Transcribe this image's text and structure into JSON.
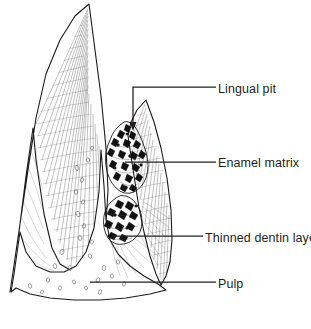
{
  "figure": {
    "line_color": "#1a1a1a",
    "text_color": "#231f20",
    "background_color": "#ffffff"
  },
  "labels": [
    {
      "id": "lingual-pit",
      "text": "Lingual pit",
      "text_x": 218,
      "text_y": 93,
      "leader_type": "elbow-arrow",
      "leader": "M216,87 L133,87 L133,126",
      "arrow_tip_x": 133,
      "arrow_tip_y": 130
    },
    {
      "id": "enamel-matrix",
      "text": "Enamel matrix",
      "text_x": 218,
      "text_y": 167,
      "leader_type": "straight",
      "leader": "M216,162 L125,162"
    },
    {
      "id": "thinned-dentin-layer",
      "text": "Thinned dentin layer",
      "text_x": 205,
      "text_y": 242,
      "leader_type": "straight",
      "leader": "M203,236 L112,236"
    },
    {
      "id": "pulp",
      "text": "Pulp",
      "text_x": 218,
      "text_y": 288,
      "leader_type": "straight",
      "leader": "M216,282 L90,282"
    }
  ],
  "structures": [
    {
      "id": "buccal-enamel-cusp",
      "name": "Buccal enamel cusp",
      "apex_x": 89,
      "apex_y": 4
    },
    {
      "id": "lingual-enamel-cusp",
      "name": "Lingual enamel cusp",
      "apex_x": 146,
      "apex_y": 100
    },
    {
      "id": "pulp-chamber",
      "name": "Pulp chamber"
    },
    {
      "id": "carious-lesion-upper",
      "name": "Upper carious lesion in enamel matrix"
    },
    {
      "id": "carious-lesion-lower",
      "name": "Lower carious lesion at dentin"
    }
  ]
}
